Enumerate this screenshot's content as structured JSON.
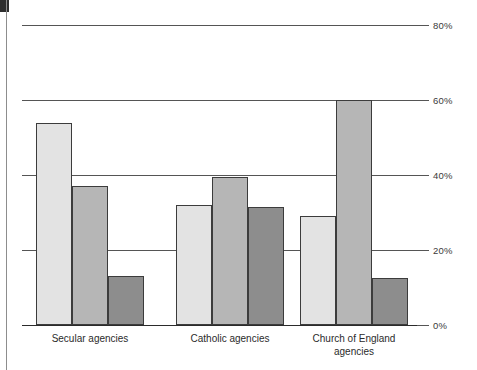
{
  "chart_data": {
    "type": "bar",
    "title": "",
    "subtitle": "",
    "xlabel": "",
    "ylabel": "",
    "categories": [
      "Secular agencies",
      "Catholic agencies",
      "Church of England\nagencies"
    ],
    "series": [
      {
        "name": "series-1",
        "color": "#e3e3e3",
        "values": [
          54,
          32,
          29
        ]
      },
      {
        "name": "series-2",
        "color": "#b6b6b6",
        "values": [
          37,
          39.5,
          60
        ]
      },
      {
        "name": "series-3",
        "color": "#8d8d8d",
        "values": [
          13,
          31.5,
          12.5
        ]
      }
    ],
    "ylim": [
      0,
      80
    ],
    "yticks": [
      0,
      20,
      40,
      60,
      80
    ],
    "ytick_labels": [
      "0%",
      "20%",
      "40%",
      "60%",
      "80%"
    ],
    "ytick_side": "right",
    "grid": true,
    "grid_axis": "y",
    "legend": "none",
    "legend_position": "none",
    "annotations": []
  },
  "figure": {
    "background": "#ffffff",
    "axis_color": "#555555",
    "baseline_color": "#2b2b2b",
    "bar_outline_color": "#3c3c3c",
    "label_color": "#2b2b2b"
  },
  "scan_artifacts": {
    "left_rule": true,
    "corner_block": true
  }
}
